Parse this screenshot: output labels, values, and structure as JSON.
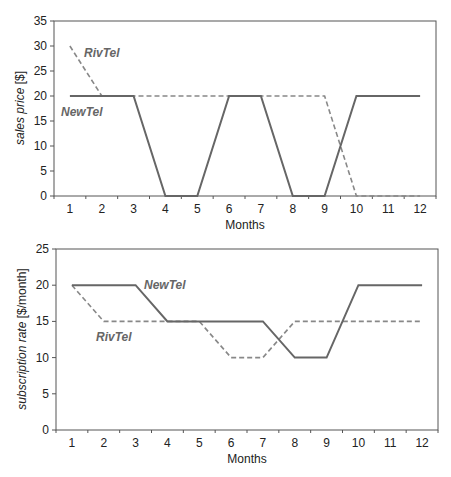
{
  "chart_data": [
    {
      "type": "line",
      "title": "",
      "xlabel": "Months",
      "ylabel_italic": "sales price",
      "ylabel_unit": " [$]",
      "ylim": [
        0,
        35
      ],
      "yticks": [
        0,
        5,
        10,
        15,
        20,
        25,
        30,
        35
      ],
      "x": [
        1,
        2,
        3,
        4,
        5,
        6,
        7,
        8,
        9,
        10,
        11,
        12
      ],
      "grid": false,
      "series": [
        {
          "name": "NewTel",
          "style": "solid",
          "color": "#666666",
          "values": [
            20,
            20,
            20,
            0,
            0,
            20,
            20,
            0,
            0,
            20,
            20,
            20
          ]
        },
        {
          "name": "RivTel",
          "style": "dashed",
          "color": "#888888",
          "values": [
            30,
            20,
            20,
            20,
            20,
            20,
            20,
            20,
            20,
            0,
            0,
            0
          ]
        }
      ],
      "labels": {
        "NewTel": "NewTel",
        "RivTel": "RivTel"
      }
    },
    {
      "type": "line",
      "title": "",
      "xlabel": "Months",
      "ylabel_italic": "subscription rate",
      "ylabel_unit": " [$/month]",
      "ylim": [
        0,
        25
      ],
      "yticks": [
        0,
        5,
        10,
        15,
        20,
        25
      ],
      "x": [
        1,
        2,
        3,
        4,
        5,
        6,
        7,
        8,
        9,
        10,
        11,
        12
      ],
      "grid": false,
      "series": [
        {
          "name": "NewTel",
          "style": "solid",
          "color": "#666666",
          "values": [
            20,
            20,
            20,
            15,
            15,
            15,
            15,
            10,
            10,
            20,
            20,
            20
          ]
        },
        {
          "name": "RivTel",
          "style": "dashed",
          "color": "#888888",
          "values": [
            20,
            15,
            15,
            15,
            15,
            10,
            10,
            15,
            15,
            15,
            15,
            15
          ]
        }
      ],
      "labels": {
        "NewTel": "NewTel",
        "RivTel": "RivTel"
      }
    }
  ],
  "charts": {
    "top": {
      "xlabel": "Months",
      "ylabel_italic": "sales price",
      "ylabel_unit": " [$]",
      "newtel_label": "NewTel",
      "rivtel_label": "RivTel"
    },
    "bottom": {
      "xlabel": "Months",
      "ylabel_italic": "subscription rate",
      "ylabel_unit": " [$/month]",
      "newtel_label": "NewTel",
      "rivtel_label": "RivTel"
    }
  }
}
